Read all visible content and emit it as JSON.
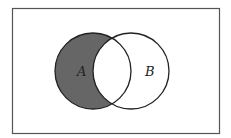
{
  "diagram": {
    "type": "venn",
    "title": "",
    "universe": {
      "x": 12,
      "y": 8,
      "width": 207,
      "height": 125,
      "stroke": "#555555"
    },
    "sets": [
      {
        "id": "A",
        "label": "A",
        "cx": 93,
        "cy": 71,
        "r": 38,
        "label_x": 80,
        "label_y": 76
      },
      {
        "id": "B",
        "label": "B",
        "cx": 131,
        "cy": 71,
        "r": 38,
        "label_x": 147,
        "label_y": 76
      }
    ],
    "shaded_region": "A minus B",
    "colors": {
      "shade": "#666666",
      "stroke": "#222222",
      "background": "#ffffff"
    }
  }
}
